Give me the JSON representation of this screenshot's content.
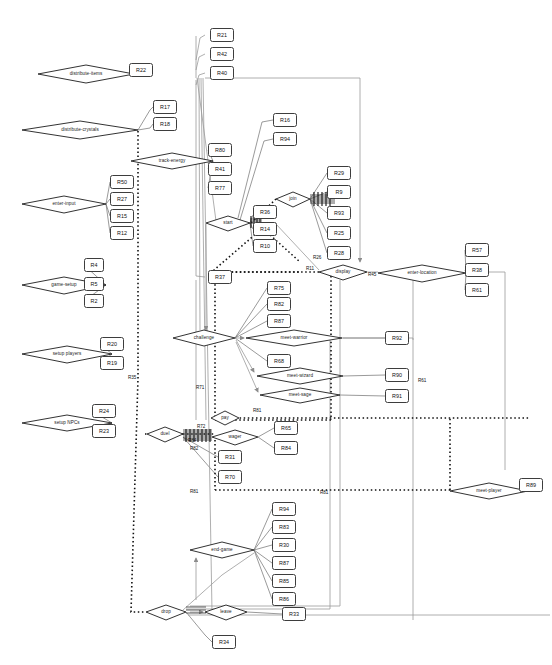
{
  "diagram": {
    "colors": {
      "node_stroke": "#1c1c1c",
      "box_stroke": "#3d3d3d",
      "edge_solid": "#8c8c8c",
      "edge_dark": "#4a4a4a",
      "edge_dotted": "#111111",
      "background": "#ffffff"
    },
    "nodes": [
      {
        "id": "distribute-items",
        "label": "distribute-items",
        "x": 38,
        "y": 65,
        "w": 96,
        "h": 18
      },
      {
        "id": "distribute-crystals",
        "label": "distribute-crystals",
        "x": 22,
        "y": 121,
        "w": 116,
        "h": 18
      },
      {
        "id": "enter-input",
        "label": "enter-input",
        "x": 22,
        "y": 196,
        "w": 84,
        "h": 17
      },
      {
        "id": "game-setup",
        "label": "game-setup",
        "x": 22,
        "y": 277,
        "w": 84,
        "h": 17
      },
      {
        "id": "setup players",
        "label": "setup players",
        "x": 22,
        "y": 346,
        "w": 90,
        "h": 17
      },
      {
        "id": "setup NPCs",
        "label": "setup NPCs",
        "x": 22,
        "y": 415,
        "w": 90,
        "h": 17
      },
      {
        "id": "track-energy",
        "label": "track-energy",
        "x": 131,
        "y": 153,
        "w": 82,
        "h": 16
      },
      {
        "id": "start",
        "label": "start",
        "x": 206,
        "y": 216,
        "w": 44,
        "h": 15
      },
      {
        "id": "join",
        "label": "join",
        "x": 276,
        "y": 192,
        "w": 34,
        "h": 15
      },
      {
        "id": "display",
        "label": "display",
        "x": 319,
        "y": 265,
        "w": 48,
        "h": 15
      },
      {
        "id": "enter-location",
        "label": "enter-location",
        "x": 378,
        "y": 265,
        "w": 88,
        "h": 17
      },
      {
        "id": "challenge",
        "label": "challenge",
        "x": 173,
        "y": 330,
        "w": 62,
        "h": 16
      },
      {
        "id": "meet-warrior",
        "label": "meet-warrior",
        "x": 246,
        "y": 330,
        "w": 96,
        "h": 16
      },
      {
        "id": "meet-wizard",
        "label": "meet-wizard",
        "x": 257,
        "y": 368,
        "w": 86,
        "h": 16
      },
      {
        "id": "meet-sage",
        "label": "meet-sage",
        "x": 260,
        "y": 388,
        "w": 80,
        "h": 15
      },
      {
        "id": "duel",
        "label": "duel",
        "x": 147,
        "y": 427,
        "w": 36,
        "h": 15
      },
      {
        "id": "pay",
        "label": "pay",
        "x": 211,
        "y": 411,
        "w": 28,
        "h": 15
      },
      {
        "id": "wager",
        "label": "wager",
        "x": 212,
        "y": 430,
        "w": 46,
        "h": 15
      },
      {
        "id": "end-game",
        "label": "end-game",
        "x": 190,
        "y": 542,
        "w": 64,
        "h": 16
      },
      {
        "id": "drop",
        "label": "drop",
        "x": 146,
        "y": 605,
        "w": 40,
        "h": 15
      },
      {
        "id": "leave",
        "label": "leave",
        "x": 205,
        "y": 605,
        "w": 42,
        "h": 15
      },
      {
        "id": "meet-player",
        "label": "meet-player",
        "x": 450,
        "y": 483,
        "w": 78,
        "h": 16
      }
    ],
    "boxes": [
      {
        "id": "R22",
        "label": "R22",
        "x": 129,
        "y": 63,
        "w": 24,
        "h": 14
      },
      {
        "id": "R17",
        "label": "R17",
        "x": 153,
        "y": 100,
        "w": 24,
        "h": 14
      },
      {
        "id": "R18",
        "label": "R18",
        "x": 153,
        "y": 117,
        "w": 24,
        "h": 14
      },
      {
        "id": "R50",
        "label": "R50",
        "x": 110,
        "y": 175,
        "w": 24,
        "h": 14
      },
      {
        "id": "R27",
        "label": "R27",
        "x": 110,
        "y": 192,
        "w": 24,
        "h": 14
      },
      {
        "id": "R15",
        "label": "R15",
        "x": 110,
        "y": 209,
        "w": 24,
        "h": 14
      },
      {
        "id": "R12",
        "label": "R12",
        "x": 110,
        "y": 226,
        "w": 24,
        "h": 14
      },
      {
        "id": "R4",
        "label": "R4",
        "x": 84,
        "y": 258,
        "w": 20,
        "h": 14
      },
      {
        "id": "R5a",
        "label": "R5",
        "x": 84,
        "y": 277,
        "w": 20,
        "h": 14
      },
      {
        "id": "R2",
        "label": "R2",
        "x": 84,
        "y": 294,
        "w": 20,
        "h": 14
      },
      {
        "id": "R20",
        "label": "R20",
        "x": 100,
        "y": 337,
        "w": 24,
        "h": 14
      },
      {
        "id": "R19",
        "label": "R19",
        "x": 100,
        "y": 356,
        "w": 24,
        "h": 14
      },
      {
        "id": "R24",
        "label": "R24",
        "x": 92,
        "y": 404,
        "w": 24,
        "h": 14
      },
      {
        "id": "R23",
        "label": "R23",
        "x": 92,
        "y": 424,
        "w": 24,
        "h": 14
      },
      {
        "id": "R21",
        "label": "R21",
        "x": 210,
        "y": 28,
        "w": 24,
        "h": 14
      },
      {
        "id": "R42",
        "label": "R42",
        "x": 210,
        "y": 47,
        "w": 24,
        "h": 14
      },
      {
        "id": "R40",
        "label": "R40",
        "x": 210,
        "y": 66,
        "w": 24,
        "h": 14
      },
      {
        "id": "R80",
        "label": "R80",
        "x": 208,
        "y": 143,
        "w": 24,
        "h": 14
      },
      {
        "id": "R41",
        "label": "R41",
        "x": 208,
        "y": 162,
        "w": 24,
        "h": 14
      },
      {
        "id": "R77",
        "label": "R77",
        "x": 208,
        "y": 181,
        "w": 24,
        "h": 14
      },
      {
        "id": "R16",
        "label": "R16",
        "x": 273,
        "y": 113,
        "w": 24,
        "h": 14
      },
      {
        "id": "R94a",
        "label": "R94",
        "x": 273,
        "y": 132,
        "w": 24,
        "h": 14
      },
      {
        "id": "R36",
        "label": "R36",
        "x": 253,
        "y": 208,
        "w": 24,
        "h": 14
      },
      {
        "id": "R14",
        "label": "R14",
        "x": 253,
        "y": 222,
        "w": 24,
        "h": 14
      },
      {
        "id": "R10",
        "label": "R10",
        "x": 253,
        "y": 239,
        "w": 24,
        "h": 14
      },
      {
        "id": "R37",
        "label": "R37",
        "x": 208,
        "y": 270,
        "w": 24,
        "h": 14
      },
      {
        "id": "R29",
        "label": "R29",
        "x": 327,
        "y": 166,
        "w": 24,
        "h": 14
      },
      {
        "id": "R9",
        "label": "R9",
        "x": 327,
        "y": 185,
        "w": 24,
        "h": 14
      },
      {
        "id": "R93",
        "label": "R93",
        "x": 327,
        "y": 206,
        "w": 24,
        "h": 14
      },
      {
        "id": "R25",
        "label": "R25",
        "x": 327,
        "y": 226,
        "w": 24,
        "h": 14
      },
      {
        "id": "R28",
        "label": "R28",
        "x": 327,
        "y": 246,
        "w": 24,
        "h": 14
      },
      {
        "id": "R57",
        "label": "R57",
        "x": 465,
        "y": 243,
        "w": 24,
        "h": 14
      },
      {
        "id": "R38",
        "label": "R38",
        "x": 465,
        "y": 263,
        "w": 24,
        "h": 14
      },
      {
        "id": "R61a",
        "label": "R61",
        "x": 465,
        "y": 283,
        "w": 24,
        "h": 14
      },
      {
        "id": "R75",
        "label": "R75",
        "x": 267,
        "y": 281,
        "w": 24,
        "h": 14
      },
      {
        "id": "R82a",
        "label": "R82",
        "x": 267,
        "y": 297,
        "w": 24,
        "h": 14
      },
      {
        "id": "R87a",
        "label": "R87",
        "x": 267,
        "y": 314,
        "w": 24,
        "h": 14
      },
      {
        "id": "R92",
        "label": "R92",
        "x": 385,
        "y": 331,
        "w": 24,
        "h": 14
      },
      {
        "id": "R68",
        "label": "R68",
        "x": 267,
        "y": 354,
        "w": 24,
        "h": 14
      },
      {
        "id": "R90",
        "label": "R90",
        "x": 385,
        "y": 368,
        "w": 24,
        "h": 14
      },
      {
        "id": "R91",
        "label": "R91",
        "x": 385,
        "y": 389,
        "w": 24,
        "h": 14
      },
      {
        "id": "R65",
        "label": "R65",
        "x": 274,
        "y": 421,
        "w": 24,
        "h": 14
      },
      {
        "id": "R84b",
        "label": "R84",
        "x": 274,
        "y": 441,
        "w": 24,
        "h": 14
      },
      {
        "id": "R31",
        "label": "R31",
        "x": 218,
        "y": 450,
        "w": 24,
        "h": 14
      },
      {
        "id": "R70",
        "label": "R70",
        "x": 218,
        "y": 470,
        "w": 24,
        "h": 14
      },
      {
        "id": "R94b",
        "label": "R94",
        "x": 272,
        "y": 502,
        "w": 24,
        "h": 14
      },
      {
        "id": "R83",
        "label": "R83",
        "x": 272,
        "y": 520,
        "w": 24,
        "h": 14
      },
      {
        "id": "R30",
        "label": "R30",
        "x": 272,
        "y": 538,
        "w": 24,
        "h": 14
      },
      {
        "id": "R87b",
        "label": "R87",
        "x": 272,
        "y": 556,
        "w": 24,
        "h": 14
      },
      {
        "id": "R85",
        "label": "R85",
        "x": 272,
        "y": 574,
        "w": 24,
        "h": 14
      },
      {
        "id": "R86",
        "label": "R86",
        "x": 272,
        "y": 592,
        "w": 24,
        "h": 14
      },
      {
        "id": "R33",
        "label": "R33",
        "x": 282,
        "y": 607,
        "w": 24,
        "h": 14
      },
      {
        "id": "R34",
        "label": "R34",
        "x": 212,
        "y": 635,
        "w": 24,
        "h": 14
      },
      {
        "id": "R89",
        "label": "R89",
        "x": 519,
        "y": 478,
        "w": 24,
        "h": 14
      }
    ],
    "edge_labels": [
      {
        "id": "R35",
        "label": "R35",
        "x": 128,
        "y": 375
      },
      {
        "id": "R71",
        "label": "R71",
        "x": 196,
        "y": 385
      },
      {
        "id": "R72",
        "label": "R72",
        "x": 197,
        "y": 424
      },
      {
        "id": "R84c",
        "label": "R84",
        "x": 188,
        "y": 438
      },
      {
        "id": "R82b",
        "label": "R82",
        "x": 190,
        "y": 446
      },
      {
        "id": "R81a",
        "label": "R81",
        "x": 253,
        "y": 408
      },
      {
        "id": "R81b",
        "label": "R81",
        "x": 190,
        "y": 489
      },
      {
        "id": "R81c",
        "label": "R81",
        "x": 320,
        "y": 490
      },
      {
        "id": "R61b",
        "label": "R61",
        "x": 418,
        "y": 378
      },
      {
        "id": "R26",
        "label": "R26",
        "x": 313,
        "y": 255
      },
      {
        "id": "R11",
        "label": "R11",
        "x": 306,
        "y": 266
      },
      {
        "id": "R45",
        "label": "R45",
        "x": 368,
        "y": 272
      }
    ]
  }
}
